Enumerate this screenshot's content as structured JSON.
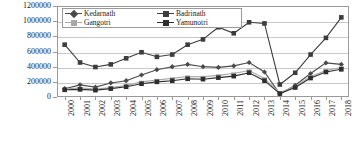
{
  "chart_data": {
    "type": "line",
    "title": "",
    "subtitle": "",
    "xlabel": "",
    "ylabel": "",
    "grid": true,
    "legend_position": "top-left-inside",
    "categories": [
      "2000",
      "2001",
      "2002",
      "2003",
      "2004",
      "2005",
      "2006",
      "2007",
      "2008",
      "2009",
      "2010",
      "2011",
      "2012",
      "2013",
      "2014",
      "2015",
      "2016",
      "2017",
      "2018"
    ],
    "ylim": [
      0,
      1200000
    ],
    "ytick_labels": [
      "0",
      "200000",
      "400000",
      "600000",
      "800000",
      "1000000",
      "1200000"
    ],
    "ytick_values": [
      0,
      200000,
      400000,
      600000,
      800000,
      1000000,
      1200000
    ],
    "series": [
      {
        "name": "Kedarnath",
        "color": "#4a4a4a",
        "marker": "diamond",
        "values": [
          110000,
          160000,
          130000,
          185000,
          215000,
          290000,
          360000,
          400000,
          430000,
          400000,
          390000,
          410000,
          455000,
          330000,
          40000,
          155000,
          310000,
          450000,
          430000
        ]
      },
      {
        "name": "Badrinath",
        "color": "#3d3d3d",
        "marker": "square",
        "values": [
          690000,
          455000,
          395000,
          430000,
          510000,
          590000,
          530000,
          560000,
          690000,
          760000,
          920000,
          840000,
          985000,
          970000,
          165000,
          320000,
          560000,
          780000,
          1050000
        ]
      },
      {
        "name": "Gangotri",
        "color": "#a8a8a8",
        "marker": "dash",
        "values": [
          105000,
          120000,
          105000,
          125000,
          150000,
          200000,
          225000,
          245000,
          270000,
          265000,
          285000,
          310000,
          350000,
          245000,
          55000,
          140000,
          270000,
          350000,
          390000
        ]
      },
      {
        "name": "Yamunotri",
        "color": "#2e2e2e",
        "marker": "square",
        "values": [
          95000,
          100000,
          90000,
          110000,
          135000,
          175000,
          200000,
          215000,
          240000,
          235000,
          255000,
          275000,
          320000,
          215000,
          45000,
          125000,
          250000,
          330000,
          365000
        ]
      }
    ]
  },
  "legend": {
    "entries": [
      {
        "label": "Kedarnath"
      },
      {
        "label": "Badrinath"
      },
      {
        "label": "Gangotri"
      },
      {
        "label": "Yamunotri"
      }
    ]
  }
}
